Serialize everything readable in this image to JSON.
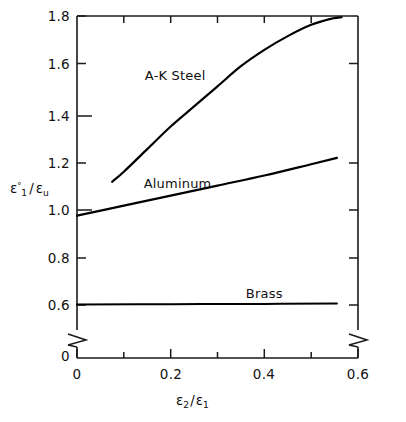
{
  "chart_data": {
    "type": "line",
    "title": "",
    "subtitle": "",
    "xlabel_parts": {
      "sym": "ε",
      "sub1": "2",
      "slash": "/",
      "sym2": "ε",
      "sub2": "1"
    },
    "ylabel_parts": {
      "sym": "ε",
      "sup": "°",
      "sub1": "1",
      "slash": "/",
      "sym2": "ε",
      "sub2": "u"
    },
    "xlabel": "ε₂/ε₁",
    "ylabel": "ε₁°/εᵤ",
    "xlim": [
      0,
      0.6
    ],
    "ylim": [
      0.55,
      1.8
    ],
    "y_axis_break": true,
    "y_break_label": "0",
    "grid": false,
    "legend": "inline-annotations",
    "x_major_ticks": [
      0,
      0.2,
      0.4,
      0.6
    ],
    "x_major_tick_labels": [
      "0",
      "0.2",
      "0.4",
      "0.6"
    ],
    "x_minor_ticks": [
      0.1,
      0.3,
      0.5
    ],
    "y_major_ticks": [
      0.6,
      0.8,
      1.0,
      1.2,
      1.4,
      1.6,
      1.8
    ],
    "y_major_tick_labels": [
      "0.6",
      "0.8",
      "1.0",
      "1.2",
      "1.4",
      "1.6",
      "1.8"
    ],
    "series": [
      {
        "name": "A-K Steel",
        "label": "A-K Steel",
        "color": "#000000",
        "x": [
          0.075,
          0.1,
          0.15,
          0.2,
          0.25,
          0.3,
          0.35,
          0.4,
          0.45,
          0.5,
          0.545,
          0.565
        ],
        "values": [
          1.14,
          1.18,
          1.27,
          1.36,
          1.44,
          1.52,
          1.6,
          1.665,
          1.72,
          1.765,
          1.79,
          1.795
        ]
      },
      {
        "name": "Aluminum",
        "label": "Aluminum",
        "color": "#000000",
        "x": [
          0.0,
          0.1,
          0.2,
          0.3,
          0.4,
          0.5,
          0.555
        ],
        "values": [
          1.005,
          1.045,
          1.085,
          1.125,
          1.165,
          1.21,
          1.235
        ]
      },
      {
        "name": "Brass",
        "label": "Brass",
        "color": "#000000",
        "x": [
          0.0,
          0.2,
          0.4,
          0.555
        ],
        "values": [
          0.652,
          0.653,
          0.654,
          0.655
        ]
      }
    ],
    "annotations": [
      {
        "text": "A-K Steel",
        "x": 0.21,
        "y": 1.565
      },
      {
        "text": "Aluminum",
        "x": 0.215,
        "y": 1.135
      },
      {
        "text": "Brass",
        "x": 0.4,
        "y": 0.695
      }
    ]
  }
}
